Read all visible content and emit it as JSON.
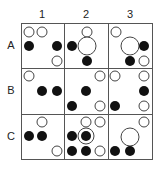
{
  "columns": [
    "1",
    "2",
    "3"
  ],
  "rows": [
    "A",
    "B",
    "C"
  ],
  "colors": {
    "line": "#555555",
    "black": "#111111",
    "white_fill": "#ffffff",
    "white_stroke": "#444444"
  },
  "cells": {
    "A1": [
      {
        "type": "white",
        "cx": 29,
        "cy": 32,
        "r": 5
      },
      {
        "type": "white",
        "cx": 42,
        "cy": 32,
        "r": 5
      },
      {
        "type": "black",
        "cx": 29,
        "cy": 46,
        "r": 5
      },
      {
        "type": "black",
        "cx": 57,
        "cy": 46,
        "r": 5
      },
      {
        "type": "white",
        "cx": 57,
        "cy": 61,
        "r": 5
      }
    ],
    "A2": [
      {
        "type": "white",
        "cx": 87,
        "cy": 32,
        "r": 5
      },
      {
        "type": "black",
        "cx": 72,
        "cy": 46,
        "r": 5
      },
      {
        "type": "white",
        "cx": 87,
        "cy": 46,
        "r": 9
      },
      {
        "type": "black",
        "cx": 87,
        "cy": 61,
        "r": 5
      }
    ],
    "A3": [
      {
        "type": "white",
        "cx": 116,
        "cy": 32,
        "r": 5
      },
      {
        "type": "white",
        "cx": 130,
        "cy": 46,
        "r": 9
      },
      {
        "type": "black",
        "cx": 144,
        "cy": 46,
        "r": 5
      },
      {
        "type": "black",
        "cx": 130,
        "cy": 61,
        "r": 5
      },
      {
        "type": "white",
        "cx": 144,
        "cy": 61,
        "r": 5
      }
    ],
    "B1": [
      {
        "type": "white",
        "cx": 29,
        "cy": 76,
        "r": 5
      },
      {
        "type": "black",
        "cx": 42,
        "cy": 91,
        "r": 5
      },
      {
        "type": "black",
        "cx": 57,
        "cy": 91,
        "r": 5
      }
    ],
    "B2": [
      {
        "type": "white",
        "cx": 100,
        "cy": 76,
        "r": 5
      },
      {
        "type": "black",
        "cx": 86,
        "cy": 91,
        "r": 5
      },
      {
        "type": "black",
        "cx": 72,
        "cy": 106,
        "r": 5
      },
      {
        "type": "white",
        "cx": 100,
        "cy": 106,
        "r": 5
      }
    ],
    "B3": [
      {
        "type": "white",
        "cx": 115,
        "cy": 76,
        "r": 5
      },
      {
        "type": "white",
        "cx": 144,
        "cy": 76,
        "r": 5
      },
      {
        "type": "black",
        "cx": 144,
        "cy": 91,
        "r": 5
      },
      {
        "type": "black",
        "cx": 115,
        "cy": 106,
        "r": 5
      },
      {
        "type": "white",
        "cx": 144,
        "cy": 106,
        "r": 5
      }
    ],
    "C1": [
      {
        "type": "white",
        "cx": 42,
        "cy": 122,
        "r": 5
      },
      {
        "type": "black",
        "cx": 29,
        "cy": 136,
        "r": 5
      },
      {
        "type": "black",
        "cx": 42,
        "cy": 136,
        "r": 5
      },
      {
        "type": "white",
        "cx": 57,
        "cy": 151,
        "r": 5
      }
    ],
    "C2": [
      {
        "type": "white",
        "cx": 86,
        "cy": 122,
        "r": 5
      },
      {
        "type": "white",
        "cx": 100,
        "cy": 122,
        "r": 5
      },
      {
        "type": "black",
        "cx": 72,
        "cy": 136,
        "r": 5
      },
      {
        "type": "ring",
        "cx": 86,
        "cy": 136,
        "r": 8
      },
      {
        "type": "black",
        "cx": 86,
        "cy": 136,
        "r": 5
      },
      {
        "type": "black",
        "cx": 72,
        "cy": 151,
        "r": 5
      },
      {
        "type": "black",
        "cx": 86,
        "cy": 151,
        "r": 5
      },
      {
        "type": "white",
        "cx": 100,
        "cy": 151,
        "r": 5
      }
    ],
    "C3": [
      {
        "type": "white",
        "cx": 144,
        "cy": 122,
        "r": 5
      },
      {
        "type": "white",
        "cx": 130,
        "cy": 137,
        "r": 9
      },
      {
        "type": "black",
        "cx": 115,
        "cy": 151,
        "r": 5
      },
      {
        "type": "black",
        "cx": 130,
        "cy": 151,
        "r": 5
      }
    ]
  }
}
